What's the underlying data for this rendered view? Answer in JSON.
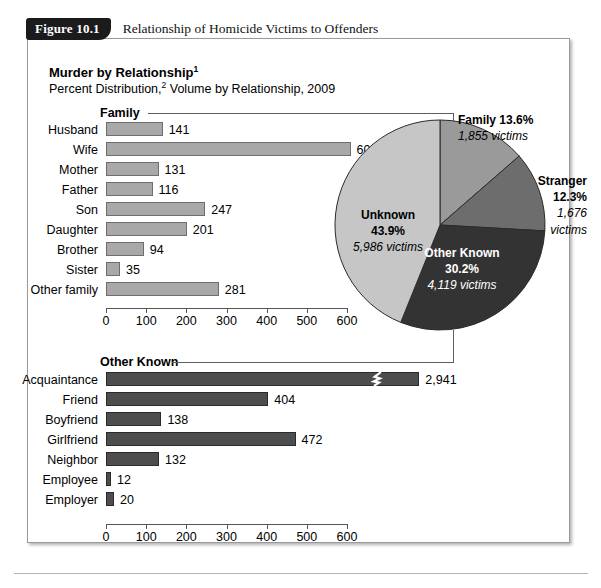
{
  "figure": {
    "number": "Figure 10.1",
    "title": "Relationship of Homicide Victims to Offenders"
  },
  "headings": {
    "main": "Murder by Relationship",
    "main_sup": "1",
    "sub_a": "Percent Distribution,",
    "sub_sup": "2",
    "sub_b": " Volume by Relationship, 2009"
  },
  "groups": {
    "family": "Family",
    "other_known": "Other Known"
  },
  "axis": {
    "ticks": [
      "0",
      "100",
      "200",
      "300",
      "400",
      "500",
      "600"
    ],
    "max": 600
  },
  "colors": {
    "family_bar": "#a8a8a8",
    "other_bar": "#4d4d4d",
    "pie_family": "#9a9a9a",
    "pie_stranger": "#6d6d6d",
    "pie_other_known": "#333333",
    "pie_unknown": "#c6c6c6",
    "panel_border": "#9a9a9a",
    "tab_background": "#1b1b1b"
  },
  "chart_data": [
    {
      "type": "bar",
      "title": "Family",
      "orientation": "horizontal",
      "xlabel": "",
      "ylabel": "",
      "xlim": [
        0,
        600
      ],
      "xticks": [
        0,
        100,
        200,
        300,
        400,
        500,
        600
      ],
      "grid": false,
      "categories": [
        "Husband",
        "Wife",
        "Mother",
        "Father",
        "Son",
        "Daughter",
        "Brother",
        "Sister",
        "Other family"
      ],
      "values": [
        141,
        609,
        131,
        116,
        247,
        201,
        94,
        35,
        281
      ],
      "labels": [
        "141",
        "609",
        "131",
        "116",
        "247",
        "201",
        "94",
        "35",
        "281"
      ]
    },
    {
      "type": "bar",
      "title": "Other Known",
      "orientation": "horizontal",
      "xlabel": "",
      "ylabel": "",
      "xlim": [
        0,
        600
      ],
      "xticks": [
        0,
        100,
        200,
        300,
        400,
        500,
        600
      ],
      "grid": false,
      "axis_break": {
        "category": "Acquaintance",
        "drawn_value": 820,
        "true_value": 2941
      },
      "categories": [
        "Acquaintance",
        "Friend",
        "Boyfriend",
        "Girlfriend",
        "Neighbor",
        "Employee",
        "Employer"
      ],
      "values": [
        2941,
        404,
        138,
        472,
        132,
        12,
        20
      ],
      "labels": [
        "2,941",
        "404",
        "138",
        "472",
        "132",
        "12",
        "20"
      ]
    },
    {
      "type": "pie",
      "title": "Percent Distribution, Volume by Relationship, 2009",
      "legend_position": "callouts",
      "categories": [
        "Family",
        "Stranger",
        "Other Known",
        "Unknown"
      ],
      "values": [
        13.6,
        12.3,
        30.2,
        43.9
      ],
      "victims": [
        1855,
        1676,
        4119,
        5986
      ],
      "slices": [
        {
          "name": "Family",
          "percent": "13.6%",
          "victims": "1,855 victims",
          "color": "#9a9a9a"
        },
        {
          "name": "Stranger",
          "percent": "12.3%",
          "victims": "1,676",
          "victims2": "victims",
          "color": "#6d6d6d"
        },
        {
          "name": "Other Known",
          "percent": "30.2%",
          "victims": "4,119 victims",
          "color": "#333333"
        },
        {
          "name": "Unknown",
          "percent": "43.9%",
          "victims": "5,986 victims",
          "color": "#c6c6c6"
        }
      ]
    }
  ]
}
